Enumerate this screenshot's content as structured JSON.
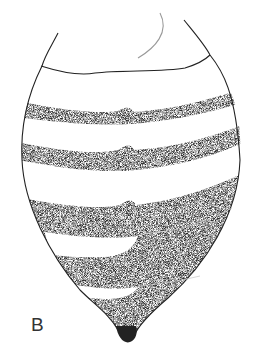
{
  "figure": {
    "panel_label": "B",
    "colors": {
      "background": "#ffffff",
      "outline": "#222222",
      "stipple_band": "#2a2a2a",
      "stipple_light": "#8a8a8a"
    },
    "dark_bands": 5,
    "pale_bands": 4
  }
}
